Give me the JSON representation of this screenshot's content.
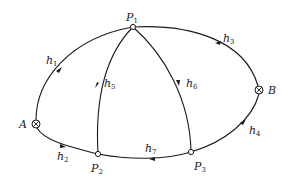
{
  "diagram": {
    "type": "directed network",
    "nodes": [
      {
        "id": "P1",
        "label": "P",
        "sub": "1",
        "x": 133,
        "y": 27,
        "marker": "open-circle"
      },
      {
        "id": "P2",
        "label": "P",
        "sub": "2",
        "x": 98,
        "y": 154,
        "marker": "open-circle"
      },
      {
        "id": "P3",
        "label": "P",
        "sub": "3",
        "x": 191,
        "y": 152,
        "marker": "open-circle"
      },
      {
        "id": "A",
        "label": "A",
        "sub": "",
        "x": 36,
        "y": 124,
        "marker": "circled-cross"
      },
      {
        "id": "B",
        "label": "B",
        "sub": "",
        "x": 259,
        "y": 90,
        "marker": "circled-cross"
      }
    ],
    "edges": [
      {
        "id": "h1",
        "label": "h",
        "sub": "1",
        "from": "A",
        "to": "P1"
      },
      {
        "id": "h2",
        "label": "h",
        "sub": "2",
        "from": "A",
        "to": "P2"
      },
      {
        "id": "h3",
        "label": "h",
        "sub": "3",
        "from": "B",
        "to": "P1"
      },
      {
        "id": "h4",
        "label": "h",
        "sub": "4",
        "from": "P3",
        "to": "B"
      },
      {
        "id": "h5",
        "label": "h",
        "sub": "5",
        "from": "P1",
        "to": "P2"
      },
      {
        "id": "h6",
        "label": "h",
        "sub": "6",
        "from": "P1",
        "to": "P3"
      },
      {
        "id": "h7",
        "label": "h",
        "sub": "7",
        "from": "P3",
        "to": "P2"
      }
    ]
  },
  "labels": {
    "P1": {
      "main": "P",
      "sub": "1"
    },
    "P2": {
      "main": "P",
      "sub": "2"
    },
    "P3": {
      "main": "P",
      "sub": "3"
    },
    "A": {
      "main": "A"
    },
    "B": {
      "main": "B"
    },
    "h1": {
      "main": "h",
      "sub": "1"
    },
    "h2": {
      "main": "h",
      "sub": "2"
    },
    "h3": {
      "main": "h",
      "sub": "3"
    },
    "h4": {
      "main": "h",
      "sub": "4"
    },
    "h5": {
      "main": "h",
      "sub": "5"
    },
    "h6": {
      "main": "h",
      "sub": "6"
    },
    "h7": {
      "main": "h",
      "sub": "7"
    }
  },
  "colors": {
    "stroke": "#1a1a1a",
    "background": "#ffffff"
  }
}
